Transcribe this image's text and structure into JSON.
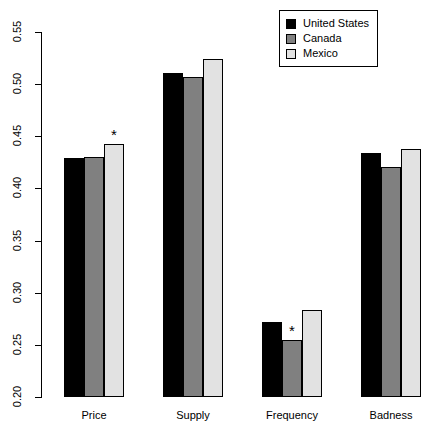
{
  "chart_data": {
    "type": "bar",
    "title": "",
    "subtitle": "",
    "xlabel": "",
    "ylabel": "",
    "categories": [
      "Price",
      "Supply",
      "Frequency",
      "Badness"
    ],
    "series": [
      {
        "name": "United States",
        "color": "#000000",
        "values": [
          0.429,
          0.511,
          0.272,
          0.434
        ]
      },
      {
        "name": "Canada",
        "color": "#808080",
        "values": [
          0.43,
          0.507,
          0.255,
          0.421
        ]
      },
      {
        "name": "Mexico",
        "color": "#e2e2e2",
        "values": [
          0.443,
          0.524,
          0.283,
          0.438
        ]
      }
    ],
    "ylim": [
      0.2,
      0.55
    ],
    "yticks": [
      "0.20",
      "0.25",
      "0.30",
      "0.35",
      "0.40",
      "0.45",
      "0.50",
      "0.55"
    ],
    "ytick_values": [
      0.2,
      0.25,
      0.3,
      0.35,
      0.4,
      0.45,
      0.5,
      0.55
    ],
    "grid": false,
    "legend_position": "top-right",
    "annotations": [
      {
        "text": "*",
        "category": "Price",
        "series": "Mexico"
      },
      {
        "text": "*",
        "category": "Frequency",
        "series": "Canada"
      }
    ]
  },
  "legend": {
    "entries": [
      {
        "label": "United States"
      },
      {
        "label": "Canada"
      },
      {
        "label": "Mexico"
      }
    ]
  }
}
